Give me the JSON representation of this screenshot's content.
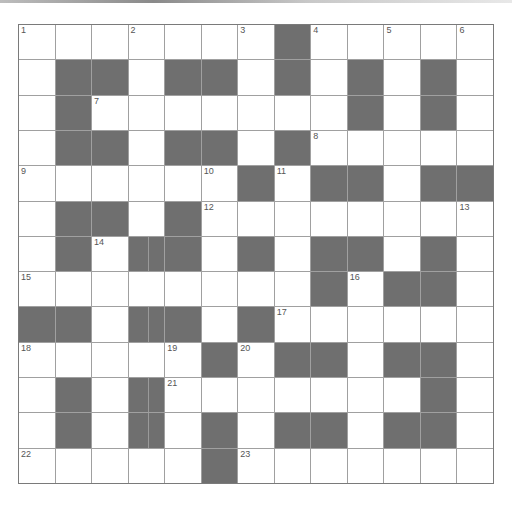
{
  "puzzle": {
    "rows": 13,
    "cols": 13,
    "colors": {
      "block": "#6f6f6f",
      "cell": "#ffffff",
      "gridline": "#a0a0a0",
      "border": "#7a7a7a",
      "number": "#555555"
    },
    "layout": [
      "WWWWWWWBWWWWW",
      "WBBWBBWBWBWBW",
      "WBWWWWWWWBWBW",
      "WBBWBBWBWWWWW",
      "WWWWWWBWBBWBB",
      "WBBWBWWWWWWWW",
      "WBWBBWBWBBWBW",
      "WWWWWWWWBWBBW",
      "BBWBBWBWWWWWW",
      "WWWWWBWBBWBBW",
      "WBWBWWWWWWWBW",
      "WBWBWBWBBWBBW",
      "WWWWWBWWWWWWW"
    ],
    "numbers": [
      {
        "r": 0,
        "c": 0,
        "n": "1"
      },
      {
        "r": 0,
        "c": 3,
        "n": "2"
      },
      {
        "r": 0,
        "c": 6,
        "n": "3"
      },
      {
        "r": 0,
        "c": 8,
        "n": "4"
      },
      {
        "r": 0,
        "c": 10,
        "n": "5"
      },
      {
        "r": 0,
        "c": 12,
        "n": "6"
      },
      {
        "r": 2,
        "c": 2,
        "n": "7"
      },
      {
        "r": 3,
        "c": 8,
        "n": "8"
      },
      {
        "r": 4,
        "c": 0,
        "n": "9"
      },
      {
        "r": 4,
        "c": 5,
        "n": "10"
      },
      {
        "r": 4,
        "c": 7,
        "n": "11"
      },
      {
        "r": 5,
        "c": 5,
        "n": "12"
      },
      {
        "r": 5,
        "c": 12,
        "n": "13"
      },
      {
        "r": 6,
        "c": 2,
        "n": "14"
      },
      {
        "r": 7,
        "c": 0,
        "n": "15"
      },
      {
        "r": 7,
        "c": 9,
        "n": "16"
      },
      {
        "r": 8,
        "c": 7,
        "n": "17"
      },
      {
        "r": 9,
        "c": 0,
        "n": "18"
      },
      {
        "r": 9,
        "c": 4,
        "n": "19"
      },
      {
        "r": 9,
        "c": 6,
        "n": "20"
      },
      {
        "r": 10,
        "c": 4,
        "n": "21"
      },
      {
        "r": 12,
        "c": 0,
        "n": "22"
      },
      {
        "r": 12,
        "c": 6,
        "n": "23"
      }
    ]
  }
}
